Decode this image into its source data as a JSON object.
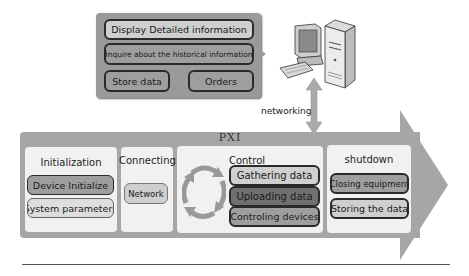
{
  "top_panel": {
    "display_label": "Display Detailed information",
    "inquire_label": "Inquire about the historical information",
    "store_label": "Store data",
    "orders_label": "Orders"
  },
  "computer_icon": "desktop-computer-with-tower",
  "connection": {
    "label": "networking",
    "icon": "bidirectional-vertical-arrow"
  },
  "pxi": {
    "title": "PXI",
    "stages": [
      {
        "title": "Initialization",
        "items": [
          "Device Initialize",
          "System parameters"
        ]
      },
      {
        "title": "Connecting",
        "items": [
          "Network"
        ]
      },
      {
        "title": "Control",
        "cycle_icon": "circular-cycle-arrows",
        "items": [
          "Gathering data",
          "Uploading data",
          "Controling devices"
        ]
      },
      {
        "title": "shutdown",
        "items": [
          "Closing equipment",
          "Storing the data"
        ]
      }
    ]
  },
  "colors": {
    "panel_gray": "#9a9a9a",
    "arrow_gray": "#a6a6a6",
    "stage_bg": "#f1f1f1",
    "pill_light": "#cfcfcf",
    "pill_mid": "#9e9e9e",
    "pill_dark": "#707070",
    "border": "#2a2a2a"
  }
}
